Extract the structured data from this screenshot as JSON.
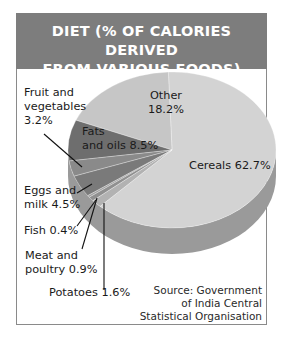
{
  "title_line1": "DIET (% OF CALORIES DERIVED",
  "title_line2": "FROM VARIOUS FOODS)",
  "labels": {
    "other_1": "Other",
    "other_2": "18.2%",
    "cereals": "Cereals 62.7%",
    "fats_1": "Fats",
    "fats_2": "and oils 8.5%",
    "fruit_1": "Fruit and",
    "fruit_2": "vegetables",
    "fruit_3": "3.2%",
    "eggs_1": "Eggs and",
    "eggs_2": "milk 4.5%",
    "fish": "Fish 0.4%",
    "meat_1": "Meat and",
    "meat_2": "poultry 0.9%",
    "potatoes": "Potatoes 1.6%"
  },
  "source": {
    "line1": "Source: Government",
    "line2": "of India Central",
    "line3": "Statistical Organisation"
  },
  "colors": {
    "header": "#7d7d7d",
    "cereals": "#d3d3d3",
    "other": "#c6c6c6",
    "fats": "#6e6e6e",
    "fruit": "#8a8a8a",
    "eggs": "#7a7a7a",
    "fish": "#a0a0a0",
    "meat": "#909090",
    "potatoes": "#b2b2b2",
    "side": "#9a9a9a"
  },
  "chart_data": {
    "type": "pie",
    "title": "DIET (% OF CALORIES DERIVED FROM VARIOUS FOODS)",
    "categories": [
      "Cereals",
      "Other",
      "Fats and oils",
      "Fruit and vegetables",
      "Eggs and milk",
      "Fish",
      "Meat and poultry",
      "Potatoes"
    ],
    "values": [
      62.7,
      18.2,
      8.5,
      3.2,
      4.5,
      0.4,
      0.9,
      1.6
    ],
    "unit": "%",
    "style": "3D tilted pie, grayscale",
    "source": "Source: Government of India Central Statistical Organisation"
  }
}
